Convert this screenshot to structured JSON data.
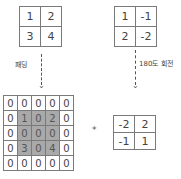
{
  "diagram": {
    "input_matrix": [
      [
        "1",
        "2"
      ],
      [
        "3",
        "4"
      ]
    ],
    "kernel_matrix": [
      [
        "1",
        "-1"
      ],
      [
        "2",
        "-2"
      ]
    ],
    "padding_label": "패딩",
    "rotate_label": "180도 회전",
    "padded_matrix": [
      [
        "0",
        "0",
        "0",
        "0",
        "0"
      ],
      [
        "0",
        "1",
        "0",
        "2",
        "0"
      ],
      [
        "0",
        "0",
        "0",
        "0",
        "0"
      ],
      [
        "0",
        "3",
        "0",
        "4",
        "0"
      ],
      [
        "0",
        "0",
        "0",
        "0",
        "0"
      ]
    ],
    "operator": "*",
    "rotated_kernel": [
      [
        "-2",
        "2"
      ],
      [
        "-1",
        "1"
      ]
    ],
    "colors": {
      "shaded_cell": "#a9a9a9",
      "border": "#7a7a7a"
    }
  }
}
